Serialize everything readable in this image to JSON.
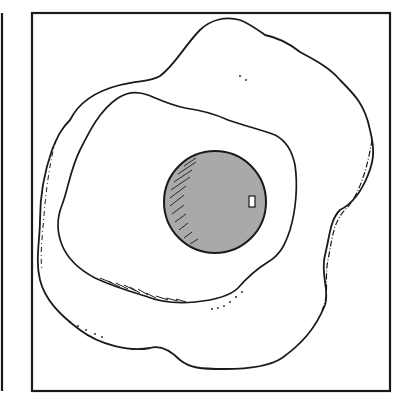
{
  "illustration": {
    "subject": "fried egg line drawing",
    "caption": "Fried egg",
    "colors": {
      "background": "#ffffff",
      "ink": "#1a1a1a",
      "yolk_fill": "#a9a9a9",
      "highlight": "#ffffff"
    },
    "frame": {
      "x": 32,
      "y": 13,
      "width": 358,
      "height": 378
    },
    "left_edge_line": {
      "x": 2,
      "y1": 13,
      "y2": 391
    },
    "yolk": {
      "cx": 215,
      "cy": 202,
      "r": 51
    },
    "highlight": {
      "x": 249,
      "y": 196,
      "width": 6,
      "height": 11
    }
  }
}
